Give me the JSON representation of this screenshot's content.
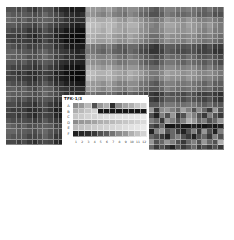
{
  "chart_data": {
    "type": "heatmap",
    "title": "",
    "colormap": "grayscale",
    "main_heatmap": {
      "n_cols": 41,
      "n_rows": 26,
      "cell_px": 5.3,
      "left_block_cols": 11,
      "left_block_rows": 26,
      "bottom_right_extra_rows": 1,
      "col_profile": [
        0.55,
        0.5,
        0.45,
        0.5,
        0.4,
        0.35,
        0.45,
        0.55,
        0.45,
        0.3,
        0.25,
        0.15,
        0.1,
        0.08,
        0.1,
        0.85,
        0.8,
        0.75,
        0.7,
        0.8,
        0.7,
        0.6,
        0.55,
        0.7,
        0.65,
        0.5,
        0.4,
        0.3,
        0.25,
        0.4,
        0.6,
        0.55,
        0.5,
        0.45,
        0.55,
        0.5,
        0.4,
        0.35,
        0.45,
        0.3,
        0.25
      ],
      "row_profile": [
        0.6,
        0.5,
        0.8,
        0.9,
        0.85,
        0.75,
        0.7,
        0.3,
        0.25,
        0.45,
        0.5,
        0.7,
        0.85,
        0.8,
        0.6,
        0.55,
        0.25,
        0.3,
        0.55,
        0.7,
        0.65,
        0.5,
        0.45,
        0.4,
        0.35,
        0.3
      ]
    },
    "inset": {
      "label": "TFK-1/3",
      "row_labels": [
        "A",
        "B",
        "C",
        "D",
        "E",
        "F"
      ],
      "col_labels": [
        "1",
        "2",
        "3",
        "4",
        "5",
        "6",
        "7",
        "8",
        "9",
        "10",
        "11",
        "12"
      ],
      "values": [
        [
          0.55,
          0.6,
          0.75,
          0.3,
          0.6,
          0.7,
          0.15,
          0.55,
          0.65,
          0.7,
          0.8,
          0.85
        ],
        [
          0.7,
          0.75,
          0.8,
          0.85,
          0.05,
          0.05,
          0.05,
          0.05,
          0.05,
          0.05,
          0.05,
          0.05
        ],
        [
          0.8,
          0.82,
          0.85,
          0.85,
          0.88,
          0.9,
          0.9,
          0.92,
          0.92,
          0.93,
          0.94,
          0.95
        ],
        [
          0.55,
          0.6,
          0.62,
          0.65,
          0.7,
          0.72,
          0.75,
          0.78,
          0.8,
          0.82,
          0.85,
          0.88
        ],
        [
          0.75,
          0.78,
          0.8,
          0.82,
          0.84,
          0.85,
          0.87,
          0.88,
          0.9,
          0.92,
          0.93,
          0.95
        ],
        [
          0.1,
          0.12,
          0.15,
          0.2,
          0.3,
          0.35,
          0.45,
          0.55,
          0.6,
          0.7,
          0.78,
          0.85
        ]
      ]
    },
    "bottom_right_block": {
      "n_cols": 16,
      "n_rows": 8,
      "values": [
        [
          0.3,
          0.5,
          0.6,
          0.2,
          0.55,
          0.6,
          0.5,
          0.4,
          0.65,
          0.5,
          0.3,
          0.55,
          0.4,
          0.2,
          0.6,
          0.3
        ],
        [
          0.2,
          0.4,
          0.3,
          0.1,
          0.5,
          0.3,
          0.6,
          0.2,
          0.3,
          0.6,
          0.5,
          0.3,
          0.2,
          0.5,
          0.3,
          0.2
        ],
        [
          0.3,
          0.2,
          0.5,
          0.4,
          0.2,
          0.6,
          0.5,
          0.3,
          0.5,
          0.7,
          0.6,
          0.4,
          0.5,
          0.3,
          0.4,
          0.6
        ],
        [
          0.5,
          0.1,
          0.3,
          0.2,
          0.4,
          0.05,
          0.05,
          0.1,
          0.05,
          0.05,
          0.1,
          0.05,
          0.05,
          0.1,
          0.05,
          0.1
        ],
        [
          0.6,
          0.3,
          0.1,
          0.5,
          0.6,
          0.3,
          0.4,
          0.2,
          0.1,
          0.3,
          0.5,
          0.2,
          0.6,
          0.3,
          0.1,
          0.5
        ],
        [
          0.2,
          0.5,
          0.4,
          0.3,
          0.2,
          0.1,
          0.4,
          0.5,
          0.3,
          0.2,
          0.1,
          0.3,
          0.4,
          0.2,
          0.5,
          0.3
        ],
        [
          0.8,
          0.5,
          0.6,
          0.3,
          0.4,
          0.6,
          0.5,
          0.3,
          0.2,
          0.4,
          0.5,
          0.3,
          0.6,
          0.4,
          0.3,
          0.7
        ],
        [
          0.3,
          0.2,
          0.4,
          0.2,
          0.3,
          0.2,
          0.1,
          0.3,
          0.2,
          0.3,
          0.4,
          0.2,
          0.3,
          0.2,
          0.3,
          0.2
        ]
      ]
    }
  }
}
